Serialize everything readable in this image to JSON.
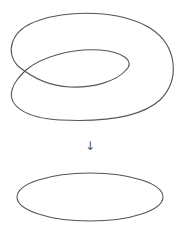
{
  "diagram": {
    "top_figure": "immersed-curve-with-self-crossing",
    "arrow_glyph": "↓",
    "bottom_figure": "ellipse",
    "stroke_color": "#555555",
    "background": "#ffffff"
  }
}
